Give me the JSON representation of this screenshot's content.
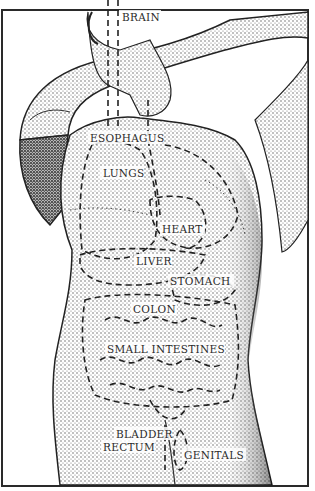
{
  "diagram": {
    "style": "stippled pen-and-ink illustration with dashed organ outlines",
    "colors": {
      "ink": "#2b2b2b",
      "background": "#ffffff",
      "frame": "#2a2a2a"
    },
    "labels": [
      {
        "id": "brain",
        "text": "BRAIN",
        "x": 122,
        "y": 12
      },
      {
        "id": "esophagus",
        "text": "ESOPHAGUS",
        "x": 90,
        "y": 133
      },
      {
        "id": "lungs",
        "text": "LUNGS",
        "x": 103,
        "y": 168
      },
      {
        "id": "heart",
        "text": "HEART",
        "x": 162,
        "y": 224
      },
      {
        "id": "liver",
        "text": "LIVER",
        "x": 136,
        "y": 256
      },
      {
        "id": "stomach",
        "text": "STOMACH",
        "x": 170,
        "y": 276
      },
      {
        "id": "colon",
        "text": "COLON",
        "x": 133,
        "y": 304
      },
      {
        "id": "small_intestines",
        "text": "SMALL INTESTINES",
        "x": 107,
        "y": 344
      },
      {
        "id": "bladder",
        "text": "BLADDER",
        "x": 116,
        "y": 429
      },
      {
        "id": "rectum",
        "text": "RECTUM",
        "x": 103,
        "y": 442
      },
      {
        "id": "genitals",
        "text": "GENITALS",
        "x": 184,
        "y": 450
      }
    ]
  }
}
